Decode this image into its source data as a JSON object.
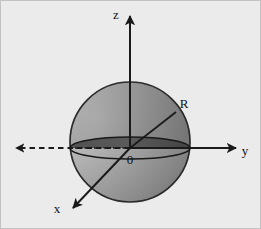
{
  "figure": {
    "width": 261,
    "height": 229,
    "background_color": "#ebebeb",
    "border_color": "#b4b4b4"
  },
  "colors": {
    "stroke": "#1a1a1a",
    "sphere_light": "#b9b9b9",
    "sphere_mid": "#8f8f8f",
    "sphere_dark": "#6e6e6e",
    "sphere_outline": "#2b2b2b",
    "equator_fill": "#5e5e5e",
    "text": "#111111"
  },
  "sphere": {
    "name": "shaded-sphere",
    "center_x": 130,
    "center_y": 142,
    "radius": 60
  },
  "equator": {
    "name": "equator-ellipse",
    "center_x": 130,
    "center_y": 148,
    "rx": 60,
    "ry": 11
  },
  "axes": [
    {
      "id": "z",
      "label": "z",
      "label_x": 116,
      "label_y": 19,
      "from_x": 130,
      "from_y": 148,
      "to_x": 130,
      "to_y": 14,
      "style": "solid",
      "arrow": true
    },
    {
      "id": "y",
      "label": "y",
      "label_x": 245,
      "label_y": 155,
      "from_x": 130,
      "from_y": 148,
      "to_x": 238,
      "to_y": 148,
      "style": "solid",
      "arrow": true
    },
    {
      "id": "y-negative",
      "label": "",
      "label_x": 0,
      "label_y": 0,
      "from_x": 130,
      "from_y": 148,
      "to_x": 13,
      "to_y": 148,
      "style": "dashed",
      "arrow": true
    },
    {
      "id": "x",
      "label": "x",
      "label_x": 54,
      "label_y": 213,
      "from_x": 130,
      "from_y": 148,
      "to_x": 70,
      "to_y": 211,
      "style": "solid",
      "arrow": true
    }
  ],
  "radius_line": {
    "name": "radius-line",
    "label": "R",
    "label_x": 180,
    "label_y": 108,
    "from_x": 130,
    "from_y": 148,
    "to_x": 176,
    "to_y": 112
  },
  "origin": {
    "name": "origin-label",
    "label": "0",
    "x": 126,
    "y": 163
  }
}
